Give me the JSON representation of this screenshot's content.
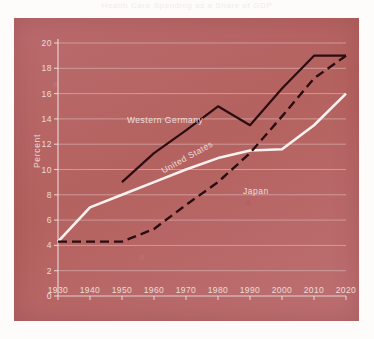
{
  "title_faint": "Health Care Spending as a Share of GDP",
  "chart_data": {
    "type": "line",
    "title": "",
    "xlabel": "",
    "ylabel": "Percent",
    "xlim": [
      1930,
      2020
    ],
    "ylim": [
      0,
      20
    ],
    "xticks": [
      1930,
      1940,
      1950,
      1960,
      1970,
      1980,
      1990,
      2000,
      2010,
      2020
    ],
    "yticks": [
      0,
      2,
      4,
      6,
      8,
      10,
      12,
      14,
      16,
      18,
      20
    ],
    "grid": "horizontal",
    "legend": "inline-annotations",
    "background_color": "#b9666a",
    "series": [
      {
        "name": "Western Germany",
        "style": "solid",
        "color": "#2b0d10",
        "x": [
          1950,
          1960,
          1970,
          1980,
          1990,
          2000,
          2010,
          2020
        ],
        "values": [
          9.0,
          11.3,
          13.1,
          15.0,
          13.5,
          16.4,
          19.0,
          19.0
        ]
      },
      {
        "name": "United States",
        "style": "solid",
        "color": "#fbf2f0",
        "x": [
          1930,
          1940,
          1950,
          1960,
          1970,
          1980,
          1990,
          2000,
          2010,
          2020
        ],
        "values": [
          4.3,
          7.0,
          8.0,
          9.0,
          10.0,
          10.9,
          11.5,
          11.6,
          13.5,
          16.0
        ]
      },
      {
        "name": "Japan",
        "style": "dashed",
        "color": "#2b0d10",
        "x": [
          1930,
          1940,
          1950,
          1960,
          1970,
          1980,
          1990,
          2000,
          2010,
          2020
        ],
        "values": [
          4.3,
          4.3,
          4.3,
          5.3,
          7.2,
          9.0,
          11.3,
          14.2,
          17.2,
          19.0
        ]
      }
    ],
    "annotations": [
      {
        "text": "Western Germany",
        "x": 1966,
        "y": 15.6
      },
      {
        "text": "United States",
        "x": 1974,
        "y": 11.9
      },
      {
        "text": "Japan",
        "x": 1997,
        "y": 10.3
      }
    ]
  }
}
